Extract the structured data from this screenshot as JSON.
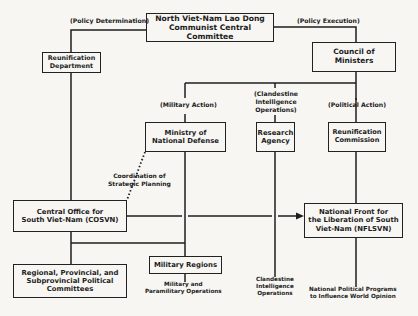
{
  "diagram": {
    "type": "organizational-chart",
    "nodes": {
      "central_committee": {
        "line1": "North Viet-Nam Lao Dong",
        "line2": "Communist Central Committee"
      },
      "reunification_department": {
        "line1": "Reunification",
        "line2": "Department"
      },
      "council_of_ministers": {
        "line1": "Council of Ministers"
      },
      "ministry_national_defense": {
        "line1": "Ministry of",
        "line2": "National Defense"
      },
      "research_agency": {
        "line1": "Research",
        "line2": "Agency"
      },
      "reunification_commission": {
        "line1": "Reunification",
        "line2": "Commission"
      },
      "cosvn": {
        "line1": "Central Office for",
        "line2": "South Viet-Nam (COSVN)"
      },
      "nflsvn": {
        "line1": "National Front for",
        "line2": "the Liberation of South",
        "line3": "Viet-Nam (NFLSVN)"
      },
      "military_regions": {
        "line1": "Military Regions"
      },
      "regional_committees": {
        "line1": "Regional, Provincial, and",
        "line2": "Subprovincial Political",
        "line3": "Committees"
      }
    },
    "edge_labels": {
      "policy_determination": "(Policy Determination)",
      "policy_execution": "(Policy Execution)",
      "military_action": "(Military Action)",
      "clandestine_ops_1": "(Clandestine",
      "clandestine_ops_2": "Intelligence",
      "clandestine_ops_3": "Operations)",
      "political_action": "(Political Action)",
      "coordination_1": "Coordination of",
      "coordination_2": "Strategic Planning"
    },
    "outputs": {
      "military_1": "Military and",
      "military_2": "Paramilitary Operations",
      "clandestine_1": "Clandestine",
      "clandestine_2": "Intelligence",
      "clandestine_3": "Operations",
      "national_1": "National Political Programs",
      "national_2": "to Influence World Opinion"
    },
    "edges": [
      {
        "from": "central_committee",
        "to": "reunification_department",
        "label": "(Policy Determination)"
      },
      {
        "from": "central_committee",
        "to": "council_of_ministers",
        "label": "(Policy Execution)"
      },
      {
        "from": "council_of_ministers",
        "to": "ministry_national_defense",
        "label": "(Military Action)"
      },
      {
        "from": "council_of_ministers",
        "to": "research_agency",
        "label": "(Clandestine Intelligence Operations)"
      },
      {
        "from": "council_of_ministers",
        "to": "reunification_commission",
        "label": "(Political Action)"
      },
      {
        "from": "reunification_department",
        "to": "cosvn"
      },
      {
        "from": "ministry_national_defense",
        "to": "cosvn",
        "label": "Coordination of Strategic Planning",
        "style": "dotted"
      },
      {
        "from": "ministry_national_defense",
        "to": "military_regions"
      },
      {
        "from": "cosvn",
        "to": "nflsvn",
        "style": "arrow"
      },
      {
        "from": "reunification_commission",
        "to": "nflsvn"
      },
      {
        "from": "cosvn",
        "to": "regional_committees"
      },
      {
        "from": "cosvn",
        "to": "military_regions"
      }
    ]
  }
}
